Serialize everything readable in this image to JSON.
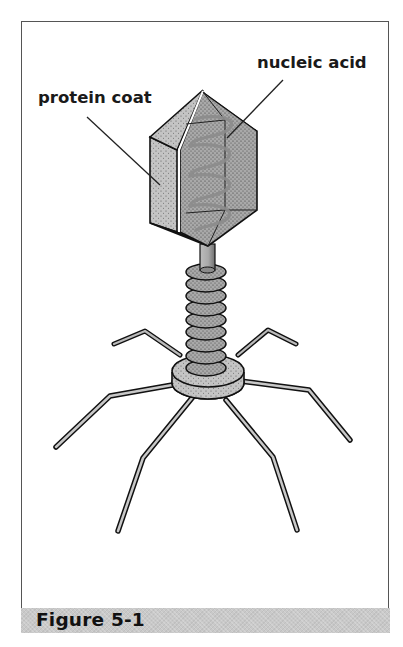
{
  "figure": {
    "caption": "Figure 5-1",
    "labels": {
      "protein_coat": "protein coat",
      "nucleic_acid": "nucleic acid"
    },
    "colors": {
      "caption_bar": "#c9c9c9",
      "frame_border": "#555555",
      "stipple_fill": "#b8b8b8",
      "outline": "#111111",
      "helix": "#8c8c8c"
    }
  }
}
